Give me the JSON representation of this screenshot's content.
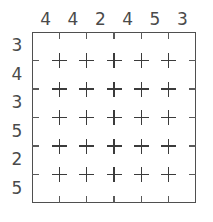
{
  "figure": {
    "kind": "grid-puzzle-diagram",
    "background_color": "#ffffff",
    "line_color": "#4f4f4f",
    "mark_color": "#3b3b3b",
    "label_color": "#4a4a4a",
    "mark_glyph": "+"
  },
  "column_labels": [
    "4",
    "4",
    "2",
    "4",
    "5",
    "3"
  ],
  "row_labels": [
    "3",
    "4",
    "3",
    "5",
    "2",
    "5"
  ],
  "grid": {
    "columns": 6,
    "rows": 6,
    "interior_mark_columns": 5,
    "interior_mark_rows": 5,
    "ticks_per_edge": 5,
    "marks": [
      [
        "+",
        "+",
        "+",
        "+",
        "+"
      ],
      [
        "+",
        "+",
        "+",
        "+",
        "+"
      ],
      [
        "+",
        "+",
        "+",
        "+",
        "+"
      ],
      [
        "+",
        "+",
        "+",
        "+",
        "+"
      ],
      [
        "+",
        "+",
        "+",
        "+",
        "+"
      ]
    ]
  },
  "geometry": {
    "box_left": 32,
    "box_top": 32,
    "box_right": 196,
    "box_bottom": 203,
    "col_step": 32.8,
    "row_step": 28.5
  }
}
